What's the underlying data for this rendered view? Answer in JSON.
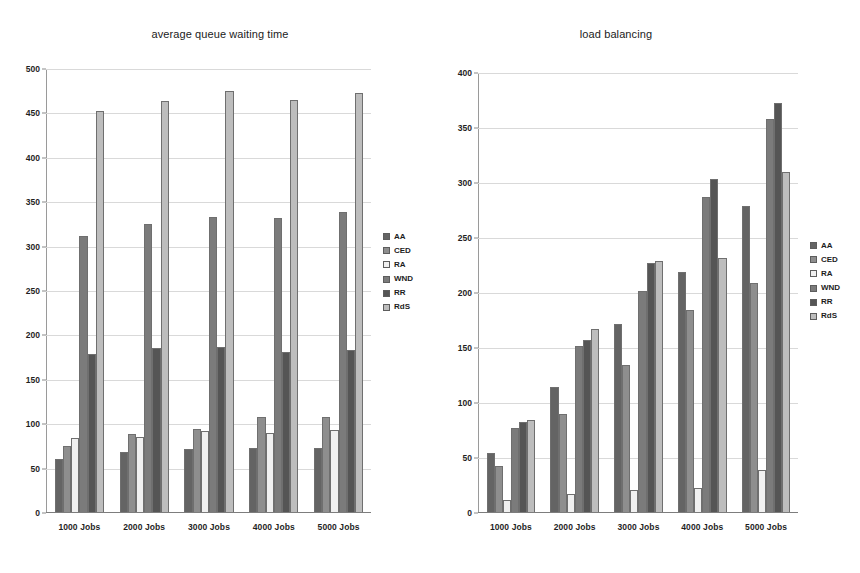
{
  "charts": [
    {
      "id": "average-queue-waiting-time",
      "title": "average queue waiting time"
    },
    {
      "id": "load-balancing",
      "title": "load balancing"
    }
  ],
  "legend": {
    "items": [
      {
        "label": "AA",
        "color": "#646464"
      },
      {
        "label": "CED",
        "color": "#8e8e8e"
      },
      {
        "label": "RA",
        "color": "#f0f0f0"
      },
      {
        "label": "WND",
        "color": "#7b7b7b"
      },
      {
        "label": "RR",
        "color": "#555555"
      },
      {
        "label": "RdS",
        "color": "#bdbdbd"
      }
    ]
  },
  "chart_data": [
    {
      "type": "bar",
      "title": "average queue waiting time",
      "xlabel": "",
      "ylabel": "",
      "ylim": [
        0,
        500
      ],
      "ystep": 50,
      "yticks": [
        0,
        50,
        100,
        150,
        200,
        250,
        300,
        350,
        400,
        450,
        500
      ],
      "grid": true,
      "legend_position": "right",
      "categories": [
        "1000 Jobs",
        "2000 Jobs",
        "3000 Jobs",
        "4000 Jobs",
        "5000 Jobs"
      ],
      "series": [
        {
          "name": "AA",
          "color": "#646464",
          "values": [
            60,
            68,
            71,
            72,
            72
          ]
        },
        {
          "name": "CED",
          "color": "#8e8e8e",
          "values": [
            74,
            88,
            94,
            107,
            107
          ]
        },
        {
          "name": "RA",
          "color": "#f0f0f0",
          "values": [
            83,
            85,
            92,
            89,
            93
          ]
        },
        {
          "name": "WND",
          "color": "#7b7b7b",
          "values": [
            311,
            325,
            333,
            332,
            339
          ]
        },
        {
          "name": "RR",
          "color": "#555555",
          "values": [
            178,
            185,
            186,
            181,
            183
          ]
        },
        {
          "name": "RdS",
          "color": "#bdbdbd",
          "values": [
            453,
            464,
            475,
            465,
            473
          ]
        }
      ]
    },
    {
      "type": "bar",
      "title": "load balancing",
      "xlabel": "",
      "ylabel": "",
      "ylim": [
        0,
        400
      ],
      "ystep": 50,
      "yticks": [
        0,
        50,
        100,
        150,
        200,
        250,
        300,
        350,
        400
      ],
      "grid": true,
      "legend_position": "right",
      "categories": [
        "1000 Jobs",
        "2000 Jobs",
        "3000 Jobs",
        "4000 Jobs",
        "5000 Jobs"
      ],
      "series": [
        {
          "name": "AA",
          "color": "#646464",
          "values": [
            54,
            114,
            171,
            219,
            279
          ]
        },
        {
          "name": "CED",
          "color": "#8e8e8e",
          "values": [
            42,
            89,
            134,
            184,
            209
          ]
        },
        {
          "name": "RA",
          "color": "#f0f0f0",
          "values": [
            11,
            16,
            20,
            22,
            38
          ]
        },
        {
          "name": "WND",
          "color": "#7b7b7b",
          "values": [
            77,
            151,
            201,
            287,
            358
          ]
        },
        {
          "name": "RR",
          "color": "#555555",
          "values": [
            82,
            157,
            227,
            303,
            373
          ]
        },
        {
          "name": "RdS",
          "color": "#bdbdbd",
          "values": [
            84,
            167,
            229,
            231,
            310
          ]
        }
      ]
    }
  ]
}
